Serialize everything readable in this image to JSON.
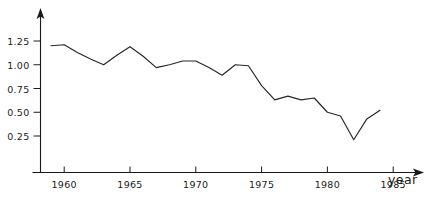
{
  "chart_data": {
    "type": "line",
    "title": "",
    "subtitle": "",
    "xlabel": "year",
    "ylabel": "",
    "grid": false,
    "legend": false,
    "legend_position": "none",
    "xlim": [
      1958.2,
      1986.5
    ],
    "ylim": [
      0.0,
      1.38
    ],
    "xticks": [
      1960,
      1965,
      1970,
      1975,
      1980,
      1985
    ],
    "xtick_labels": [
      "1960",
      "1965",
      "1970",
      "1975",
      "1980",
      "1985"
    ],
    "yticks": [
      0.25,
      0.5,
      0.75,
      1.0,
      1.25
    ],
    "ytick_labels": [
      "0.25",
      "0.50",
      "0.75",
      "1.00",
      "1.25"
    ],
    "x": [
      1959,
      1960,
      1961,
      1962,
      1963,
      1964,
      1965,
      1966,
      1967,
      1968,
      1969,
      1970,
      1971,
      1972,
      1973,
      1974,
      1975,
      1976,
      1977,
      1978,
      1979,
      1980,
      1981,
      1982,
      1983,
      1984
    ],
    "values": [
      1.2,
      1.21,
      1.13,
      1.06,
      1.0,
      1.1,
      1.19,
      1.09,
      0.97,
      1.0,
      1.04,
      1.04,
      0.97,
      0.89,
      1.0,
      0.99,
      0.78,
      0.63,
      0.67,
      0.63,
      0.65,
      0.5,
      0.46,
      0.21,
      0.43,
      0.52
    ],
    "series": [
      {
        "name": "",
        "values": [
          1.2,
          1.21,
          1.13,
          1.06,
          1.0,
          1.1,
          1.19,
          1.09,
          0.97,
          1.0,
          1.04,
          1.04,
          0.97,
          0.89,
          1.0,
          0.99,
          0.78,
          0.63,
          0.67,
          0.63,
          0.65,
          0.5,
          0.46,
          0.21,
          0.43,
          0.52
        ],
        "color": "#262626"
      }
    ],
    "annotations": [],
    "axis_arrows": [
      "x-right",
      "y-up"
    ],
    "line_color": "#262626",
    "axis_color": "#1a1a1a"
  }
}
